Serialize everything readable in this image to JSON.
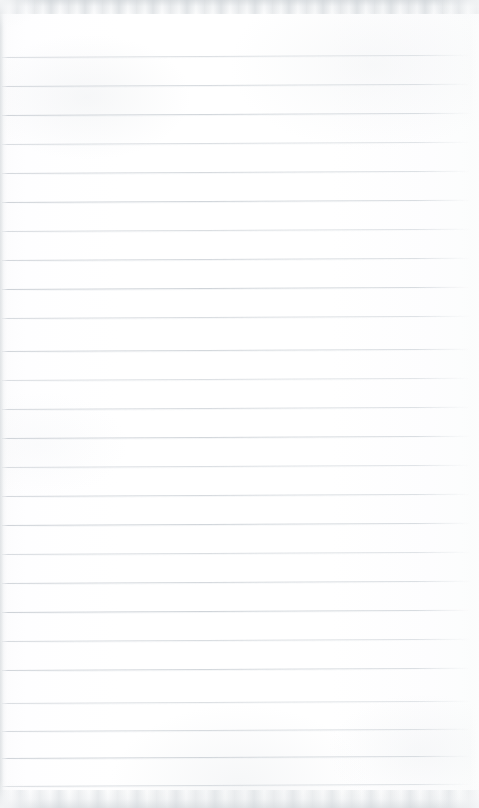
{
  "document": {
    "kind": "scanned-page",
    "title": "Blank ruled notebook page",
    "medium": "lined notebook paper",
    "page_width_px": 479,
    "page_height_px": 808,
    "orientation": "portrait",
    "handwriting_present": false,
    "printed_text_present": false,
    "body_text": "",
    "margin_rule_present": false,
    "header_text": "",
    "footer_text": "",
    "page_number": ""
  },
  "colors": {
    "page_background": "#fdfdfe",
    "paper_white": "#ffffff",
    "rule_line": "#cdd2d7",
    "rule_line_soft": "#e4e7ea",
    "scan_edge_band": "#d6dadd",
    "edge_shadow": "#ccd1d5"
  },
  "ruling": {
    "style": "wide-ruled horizontal lines",
    "line_count": 26,
    "line_spacing_px": 29,
    "first_line_y_px": 57,
    "last_line_y_px": 786,
    "line_thickness_px": 1,
    "line_left_inset_px": 2,
    "line_right_inset_px": 8,
    "skew_deg": -0.28,
    "line_y_positions": [
      57,
      86,
      115,
      144,
      173,
      202,
      231,
      260,
      289,
      318,
      351,
      380,
      409,
      438,
      467,
      496,
      525,
      554,
      583,
      612,
      641,
      670,
      703,
      731,
      758,
      786
    ]
  },
  "scan_artifacts": {
    "top_band_height_px": 14,
    "bottom_band_height_px": 18,
    "left_edge_shadow_px": 7,
    "right_edge_highlight_px": 9,
    "description": "mottled grey scanner bands along the top and bottom edges"
  }
}
